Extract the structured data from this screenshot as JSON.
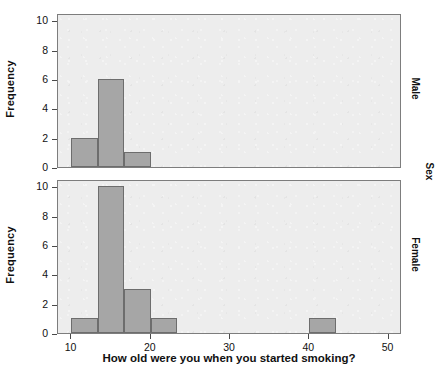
{
  "chart_data": {
    "type": "bar",
    "title": "",
    "subtitle": "",
    "xlabel": "How old were you when you started smoking?",
    "ylabel": "Frequency",
    "outer_strip_label": "Sex",
    "xlim": [
      8.3,
      51.7
    ],
    "ylim": [
      0,
      10.5
    ],
    "xticks": [
      10,
      20,
      30,
      40,
      50
    ],
    "xtick_labels": [
      "10",
      "20",
      "30",
      "40",
      "50"
    ],
    "yticks": [
      0,
      2,
      4,
      6,
      8,
      10
    ],
    "ytick_labels": [
      "0",
      "2",
      "4",
      "6",
      "8",
      "10"
    ],
    "grid": false,
    "legend": "none",
    "bin_width": 3.3333,
    "bar_color": "#a6a6a6",
    "bar_edge_color": "#6d6d6d",
    "panel_background": "#ededed",
    "panel_border_color": "#7d7d7d",
    "panels": [
      {
        "strip_label": "Male",
        "ylabel": "Frequency",
        "bins": [
          {
            "start": 10.0,
            "end": 13.3333,
            "count": 2
          },
          {
            "start": 13.3333,
            "end": 16.6667,
            "count": 6
          },
          {
            "start": 16.6667,
            "end": 20.0,
            "count": 1
          }
        ]
      },
      {
        "strip_label": "Female",
        "ylabel": "Frequency",
        "bins": [
          {
            "start": 10.0,
            "end": 13.3333,
            "count": 1
          },
          {
            "start": 13.3333,
            "end": 16.6667,
            "count": 10
          },
          {
            "start": 16.6667,
            "end": 20.0,
            "count": 3
          },
          {
            "start": 20.0,
            "end": 23.3333,
            "count": 1
          },
          {
            "start": 40.0,
            "end": 43.3333,
            "count": 1
          }
        ]
      }
    ]
  }
}
